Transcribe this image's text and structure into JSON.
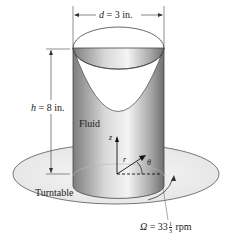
{
  "diagram": {
    "labels": {
      "diameter": {
        "var": "d",
        "text": " = 3 in."
      },
      "height": {
        "var": "h",
        "text": " = 8 in."
      },
      "fluid": "Fluid",
      "turntable": "Turntable",
      "z_axis": "z",
      "r_axis": "r",
      "theta": "θ",
      "omega": {
        "var": "Ω",
        "prefix": " = 33",
        "frac_num": "1",
        "frac_den": "3",
        "suffix": " rpm"
      }
    },
    "colors": {
      "cylinder_dark": "#8a8a8a",
      "cylinder_light": "#e6e6e6",
      "turntable_fill": "#eeeeee",
      "line": "#333333"
    }
  }
}
